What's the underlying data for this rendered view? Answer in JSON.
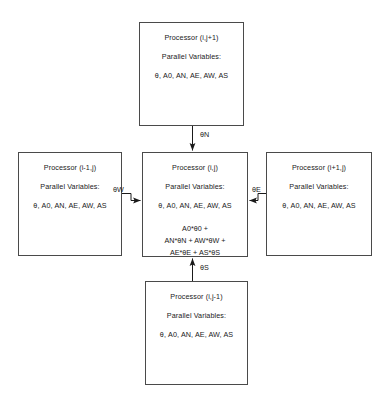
{
  "diagram": {
    "title_visible": false,
    "line_color": "#4a4a4a",
    "text_color": "#1a1a1a",
    "background": "#ffffff",
    "common_labels": {
      "parallel_variables_heading": "Parallel Variables:",
      "variables": "θ, A0, AN, AE, AW, AS"
    },
    "boxes": {
      "top": {
        "name": "Processor (i,j+1)",
        "heading": "Parallel Variables:",
        "variables": "θ, A0, AN, AE, AW, AS"
      },
      "left": {
        "name": "Processor (i-1,j)",
        "heading": "Parallel Variables:",
        "variables": "θ, A0, AN, AE, AW, AS"
      },
      "center": {
        "name": "Processor (i,j)",
        "heading": "Parallel Variables:",
        "variables": "θ, A0, AN, AE, AW, AS",
        "formula": [
          "A0*θ0 +",
          "AN*θN + AW*θW +",
          "AE*θE + AS*θS"
        ]
      },
      "right": {
        "name": "Processor (i+1,j)",
        "heading": "Parallel Variables:",
        "variables": "θ, A0, AN, AE, AW, AS"
      },
      "bottom": {
        "name": "Processor (i,j-1)",
        "heading": "Parallel Variables:",
        "variables": "θ, A0, AN, AE, AW, AS"
      }
    },
    "arrows": {
      "north": {
        "label": "θN",
        "direction": "down",
        "from": "top",
        "to": "center"
      },
      "south": {
        "label": "θS",
        "direction": "up",
        "from": "bottom",
        "to": "center"
      },
      "west": {
        "label": "θW",
        "direction": "right",
        "from": "left",
        "to": "center"
      },
      "east": {
        "label": "θE",
        "direction": "left",
        "from": "right",
        "to": "center"
      }
    }
  }
}
